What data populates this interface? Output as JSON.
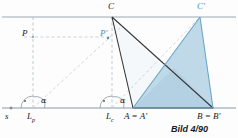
{
  "figure": {
    "caption": "Bild 4/90",
    "colors": {
      "baseline": "#8a9aa8",
      "dark_stroke": "#3a3a3a",
      "blue_stroke": "#6aa6c8",
      "blue_fill": "#b9d5e6",
      "light_fill": "#eef4f8",
      "dashed": "#b9c4cc",
      "label_blue": "#4a90b8",
      "label_dark": "#1a1a1a"
    },
    "labels": {
      "s": "s",
      "Lp": "L",
      "Lp_sub": "p",
      "Lc": "L",
      "Lc_sub": "c",
      "P": "P",
      "P_prime": "P'",
      "C": "C",
      "C_prime": "C'",
      "A_eq_Aprime": "A = A'",
      "B_eq_Bprime": "B = B'",
      "alpha_left": "α",
      "alpha_right": "α"
    },
    "geometry": {
      "top_line_y": 17,
      "base_line_y": 108,
      "C": [
        112,
        17
      ],
      "C_prime": [
        200,
        17
      ],
      "A": [
        133,
        108
      ],
      "B": [
        213,
        108
      ],
      "Lp": [
        33,
        108
      ],
      "Lc": [
        112,
        108
      ],
      "P": [
        33,
        37
      ],
      "P_prime": [
        108,
        37
      ]
    }
  }
}
